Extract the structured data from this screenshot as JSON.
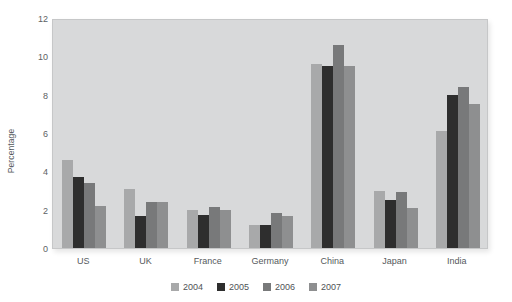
{
  "chart_data": {
    "type": "bar",
    "title": "",
    "xlabel": "",
    "ylabel": "Percentage",
    "ylim": [
      0,
      12
    ],
    "ytick_labels": [
      "0",
      "2",
      "4",
      "6",
      "8",
      "10",
      "12"
    ],
    "yticks": [
      0,
      2,
      4,
      6,
      8,
      10,
      12
    ],
    "grid": false,
    "legend_position": "bottom-center",
    "categories": [
      "US",
      "UK",
      "France",
      "Germany",
      "China",
      "Japan",
      "India"
    ],
    "series": [
      {
        "name": "2004",
        "color": "#a8a9aa",
        "values": [
          4.6,
          3.1,
          2.0,
          1.2,
          9.6,
          3.0,
          6.1
        ]
      },
      {
        "name": "2005",
        "color": "#2e2e2e",
        "values": [
          3.7,
          1.65,
          1.7,
          1.2,
          9.5,
          2.5,
          8.0
        ]
      },
      {
        "name": "2006",
        "color": "#78797a",
        "values": [
          3.4,
          2.4,
          2.15,
          1.85,
          10.6,
          2.9,
          8.4
        ]
      },
      {
        "name": "2007",
        "color": "#8e8f90",
        "values": [
          2.2,
          2.4,
          2.0,
          1.65,
          9.5,
          2.1,
          7.5
        ]
      }
    ],
    "plot_background": "#d8d9da",
    "page_background": "#ffffff"
  },
  "legend": {
    "entries": [
      {
        "label": "2004"
      },
      {
        "label": "2005"
      },
      {
        "label": "2006"
      },
      {
        "label": "2007"
      }
    ]
  }
}
